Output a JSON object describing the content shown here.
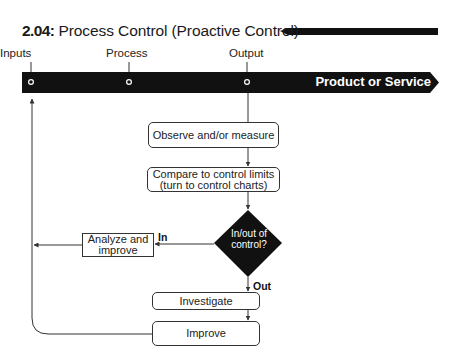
{
  "title": {
    "number": "2.04:",
    "text": " Process Control (Proactive Control)"
  },
  "stages": {
    "inputs": "Inputs",
    "process": "Process",
    "output": "Output"
  },
  "bar": {
    "label": "Product or Service"
  },
  "nodes": {
    "observe": "Observe and/or measure",
    "compare_line1": "Compare to control limits",
    "compare_line2": "(turn to control charts)",
    "decision_line1": "In/out of",
    "decision_line2": "control?",
    "analyze_line1": "Analyze and",
    "analyze_line2": "improve",
    "investigate": "Investigate",
    "improve": "Improve"
  },
  "edges": {
    "in_label": "In",
    "out_label": "Out"
  },
  "colors": {
    "bar": "#111111",
    "diamond": "#111111",
    "line": "#333333"
  }
}
